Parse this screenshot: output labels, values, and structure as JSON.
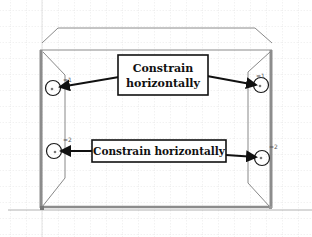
{
  "diagram": {
    "type": "cad-sketch-annotation",
    "grid": {
      "spacing": 16,
      "color": "#cfcfcf",
      "style": "dotted"
    },
    "colors": {
      "sketch_line": "#7a7a7a",
      "sketch_edge_thick": "#8c8c8c",
      "circle": "#1a1a1a",
      "arrow": "#111111",
      "callout_border": "#111111",
      "callout_bg": "#ffffff",
      "axis": "#9a9a9a"
    },
    "callouts": [
      {
        "id": "top",
        "lines": [
          "Constrain",
          "horizontally"
        ]
      },
      {
        "id": "bottom",
        "lines": [
          "Constrain horizontally"
        ]
      }
    ],
    "constraint_markers": [
      {
        "id": "tl",
        "label": "=1"
      },
      {
        "id": "tr",
        "label": "=1"
      },
      {
        "id": "bl",
        "label": "=2"
      },
      {
        "id": "br",
        "label": "=2"
      }
    ]
  }
}
